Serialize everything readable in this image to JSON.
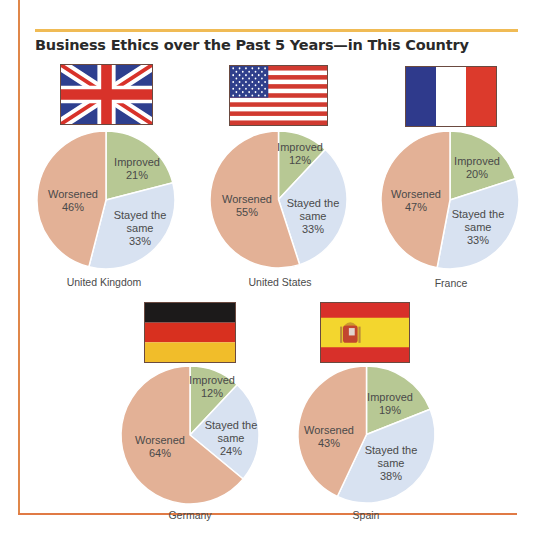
{
  "title": "Business Ethics over the Past 5 Years—in This Country",
  "colors": {
    "improved": "#b7c894",
    "stayed": "#d8e2f1",
    "worsened": "#e3b196",
    "left_rule": "#e0874a",
    "top_rule": "#f0bb55",
    "bottom_rule": "#e07a45"
  },
  "charts": [
    {
      "country": "United Kingdom",
      "flag": "uk-flag",
      "improved_label": "Improved",
      "improved_value": "21%",
      "stayed_label_1": "Stayed the",
      "stayed_label_2": "same",
      "stayed_value": "33%",
      "worsened_label": "Worsened",
      "worsened_value": "46%"
    },
    {
      "country": "United States",
      "flag": "us-flag",
      "improved_label": "Improved",
      "improved_value": "12%",
      "stayed_label_1": "Stayed the",
      "stayed_label_2": "same",
      "stayed_value": "33%",
      "worsened_label": "Worsened",
      "worsened_value": "55%"
    },
    {
      "country": "France",
      "flag": "france-flag",
      "improved_label": "Improved",
      "improved_value": "20%",
      "stayed_label_1": "Stayed the",
      "stayed_label_2": "same",
      "stayed_value": "33%",
      "worsened_label": "Worsened",
      "worsened_value": "47%"
    },
    {
      "country": "Germany",
      "flag": "germany-flag",
      "improved_label": "Improved",
      "improved_value": "12%",
      "stayed_label_1": "Stayed the",
      "stayed_label_2": "same",
      "stayed_value": "24%",
      "worsened_label": "Worsened",
      "worsened_value": "64%"
    },
    {
      "country": "Spain",
      "flag": "spain-flag",
      "improved_label": "Improved",
      "improved_value": "19%",
      "stayed_label_1": "Stayed the",
      "stayed_label_2": "same",
      "stayed_value": "38%",
      "worsened_label": "Worsened",
      "worsened_value": "43%"
    }
  ],
  "chart_data": [
    {
      "type": "pie",
      "title": "United Kingdom",
      "categories": [
        "Improved",
        "Stayed the same",
        "Worsened"
      ],
      "values": [
        21,
        33,
        46
      ]
    },
    {
      "type": "pie",
      "title": "United States",
      "categories": [
        "Improved",
        "Stayed the same",
        "Worsened"
      ],
      "values": [
        12,
        33,
        55
      ]
    },
    {
      "type": "pie",
      "title": "France",
      "categories": [
        "Improved",
        "Stayed the same",
        "Worsened"
      ],
      "values": [
        20,
        33,
        47
      ]
    },
    {
      "type": "pie",
      "title": "Germany",
      "categories": [
        "Improved",
        "Stayed the same",
        "Worsened"
      ],
      "values": [
        12,
        24,
        64
      ]
    },
    {
      "type": "pie",
      "title": "Spain",
      "categories": [
        "Improved",
        "Stayed the same",
        "Worsened"
      ],
      "values": [
        19,
        38,
        43
      ]
    }
  ]
}
